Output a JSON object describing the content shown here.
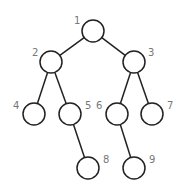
{
  "diagram": {
    "type": "binary-tree",
    "nodes": [
      {
        "id": "1",
        "label": "1",
        "cx": 93,
        "cy": 31,
        "lx": 74,
        "ly": 24
      },
      {
        "id": "2",
        "label": "2",
        "cx": 51,
        "cy": 62,
        "lx": 32,
        "ly": 56
      },
      {
        "id": "3",
        "label": "3",
        "cx": 134,
        "cy": 62,
        "lx": 148,
        "ly": 56
      },
      {
        "id": "4",
        "label": "4",
        "cx": 34,
        "cy": 114,
        "lx": 13,
        "ly": 109
      },
      {
        "id": "5",
        "label": "5",
        "cx": 70,
        "cy": 114,
        "lx": 85,
        "ly": 109
      },
      {
        "id": "6",
        "label": "6",
        "cx": 117,
        "cy": 114,
        "lx": 96,
        "ly": 109
      },
      {
        "id": "7",
        "label": "7",
        "cx": 152,
        "cy": 114,
        "lx": 167,
        "ly": 109
      },
      {
        "id": "8",
        "label": "8",
        "cx": 88,
        "cy": 168,
        "lx": 103,
        "ly": 163
      },
      {
        "id": "9",
        "label": "9",
        "cx": 134,
        "cy": 168,
        "lx": 149,
        "ly": 163
      }
    ],
    "edges": [
      [
        "1",
        "2"
      ],
      [
        "1",
        "3"
      ],
      [
        "2",
        "4"
      ],
      [
        "2",
        "5"
      ],
      [
        "3",
        "6"
      ],
      [
        "3",
        "7"
      ],
      [
        "5",
        "8"
      ],
      [
        "6",
        "9"
      ]
    ]
  }
}
